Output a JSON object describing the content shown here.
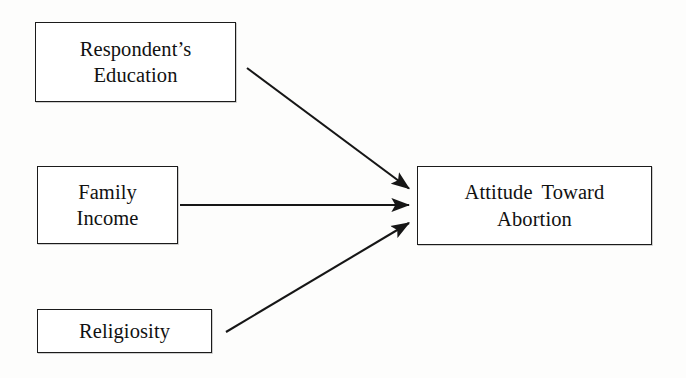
{
  "diagram": {
    "type": "causal-path-diagram",
    "background_color": "#fdfdfc",
    "line_color": "#161616",
    "box_border_color": "#1b1b1b",
    "box_fill_color": "#ffffff",
    "nodes": [
      {
        "id": "education",
        "label": "Respondent’s\nEducation",
        "role": "independent-variable",
        "x": 35,
        "y": 22,
        "width": 201,
        "height": 80
      },
      {
        "id": "income",
        "label": "Family\nIncome",
        "role": "independent-variable",
        "x": 37,
        "y": 166,
        "width": 141,
        "height": 78
      },
      {
        "id": "religiosity",
        "label": "Religiosity",
        "role": "independent-variable",
        "x": 37,
        "y": 309,
        "width": 175,
        "height": 44
      },
      {
        "id": "outcome",
        "label": "Attitude Toward\nAbortion",
        "role": "dependent-variable",
        "x": 417,
        "y": 166,
        "width": 235,
        "height": 79
      }
    ],
    "edges": [
      {
        "id": "education-to-outcome",
        "from": "education",
        "to": "outcome",
        "style": "single-headed-arrow",
        "x1": 247,
        "y1": 68,
        "x2": 412,
        "y2": 190
      },
      {
        "id": "income-to-outcome",
        "from": "income",
        "to": "outcome",
        "style": "single-headed-arrow",
        "x1": 180,
        "y1": 205,
        "x2": 412,
        "y2": 205
      },
      {
        "id": "religiosity-to-outcome",
        "from": "religiosity",
        "to": "outcome",
        "style": "single-headed-arrow",
        "x1": 226,
        "y1": 332,
        "x2": 412,
        "y2": 221
      }
    ]
  }
}
